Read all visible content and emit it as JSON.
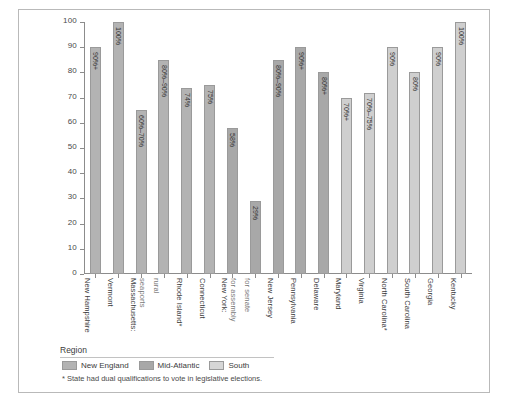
{
  "chart_data": {
    "type": "bar",
    "title": "",
    "xlabel": "",
    "ylabel": "Percentage",
    "ylim": [
      0,
      100
    ],
    "yticks": [
      0,
      10,
      20,
      30,
      40,
      50,
      60,
      70,
      80,
      90,
      100
    ],
    "grid": false,
    "legend_position": "bottom-left",
    "categories": [
      "New Hampshire",
      "Vermont",
      "Massachusetts: seaports",
      "rural",
      "Rhode Island*",
      "Connecticut",
      "New York: for assembly",
      "for senate",
      "New Jersey",
      "Pennsylvania",
      "Delaware",
      "Maryland",
      "Virginia",
      "North Carolina*",
      "South Carolina",
      "Georgia",
      "Kentucky"
    ],
    "bars": [
      {
        "label": "New Hampshire",
        "sub": "",
        "value": 90,
        "value_label": "90%+",
        "region": "New England"
      },
      {
        "label": "Vermont",
        "sub": "",
        "value": 100,
        "value_label": "100%",
        "region": "New England"
      },
      {
        "label": "Massachusetts:",
        "sub": "seaports",
        "value": 65,
        "value_label": "60%–70%",
        "region": "New England"
      },
      {
        "label": "",
        "sub": "rural",
        "value": 85,
        "value_label": "80%–90%",
        "region": "New England"
      },
      {
        "label": "Rhode Island*",
        "sub": "",
        "value": 74,
        "value_label": "74%",
        "region": "New England"
      },
      {
        "label": "Connecticut",
        "sub": "",
        "value": 75,
        "value_label": "75%",
        "region": "New England"
      },
      {
        "label": "New York:",
        "sub": "for assembly",
        "value": 58,
        "value_label": "58%",
        "region": "Mid-Atlantic"
      },
      {
        "label": "",
        "sub": "for senate",
        "value": 29,
        "value_label": "29%",
        "region": "Mid-Atlantic"
      },
      {
        "label": "New Jersey",
        "sub": "",
        "value": 85,
        "value_label": "80%–90%",
        "region": "Mid-Atlantic"
      },
      {
        "label": "Pennsylvania",
        "sub": "",
        "value": 90,
        "value_label": "90%+",
        "region": "Mid-Atlantic"
      },
      {
        "label": "Delaware",
        "sub": "",
        "value": 80,
        "value_label": "80%+",
        "region": "Mid-Atlantic"
      },
      {
        "label": "Maryland",
        "sub": "",
        "value": 70,
        "value_label": "70%+",
        "region": "South"
      },
      {
        "label": "Virginia",
        "sub": "",
        "value": 72,
        "value_label": "70%–75%",
        "region": "South"
      },
      {
        "label": "North Carolina*",
        "sub": "",
        "value": 90,
        "value_label": "90%",
        "region": "South"
      },
      {
        "label": "South Carolina",
        "sub": "",
        "value": 80,
        "value_label": "80%",
        "region": "South"
      },
      {
        "label": "Georgia",
        "sub": "",
        "value": 90,
        "value_label": "90%",
        "region": "South"
      },
      {
        "label": "Kentucky",
        "sub": "",
        "value": 100,
        "value_label": "100%",
        "region": "South"
      }
    ],
    "series": [
      {
        "name": "New England",
        "color": "#b3b3b3"
      },
      {
        "name": "Mid-Atlantic",
        "color": "#a8a8a8"
      },
      {
        "name": "South",
        "color": "#d6d6d6"
      }
    ]
  },
  "legend": {
    "title": "Region",
    "items": [
      {
        "label": "New England",
        "key": "new-england"
      },
      {
        "label": "Mid-Atlantic",
        "key": "mid-atlantic"
      },
      {
        "label": "South",
        "key": "south"
      }
    ],
    "note": "* State had dual qualifications to vote in legislative elections."
  }
}
